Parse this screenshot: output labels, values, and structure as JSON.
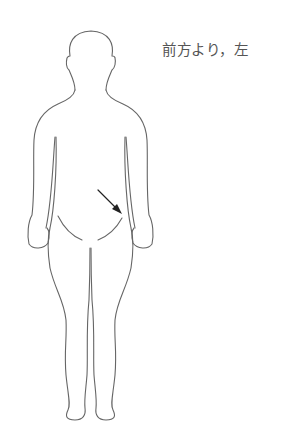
{
  "caption": {
    "text": "前方より，左"
  },
  "figure": {
    "marker": "arrow pointing to left inguinal region"
  },
  "colors": {
    "outline": "#666666",
    "arrow": "#222222",
    "caption": "#555555",
    "background": "#ffffff"
  }
}
